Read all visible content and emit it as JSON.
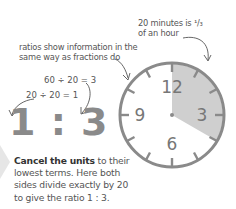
{
  "annotations": {
    "top_right": [
      "20 minutes is ¹/₃",
      "of an hour"
    ],
    "middle_left": [
      "ratios show information in the",
      "same way as fractions do"
    ]
  },
  "equations": {
    "top": "60 ÷ 20 = 3",
    "bottom": "20 ÷ 20 = 1"
  },
  "ratio": "1 : 3",
  "caption": {
    "bold": "Cancel the units",
    "rest": " to their lowest terms. Here both sides divide exactly by 20 to give the ratio 1 : 3."
  },
  "clock": {
    "numbers": [
      "12",
      "3",
      "6",
      "9"
    ],
    "shaded_minutes": 20,
    "face_color": "#ffffff",
    "rim_color": "#8a8a8a",
    "shade_color": "#cfcfcf"
  }
}
